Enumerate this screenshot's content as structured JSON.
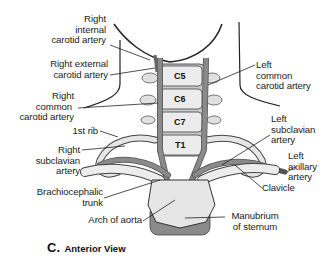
{
  "figure": {
    "caption_letter": "C.",
    "caption_text": "Anterior View",
    "vertebrae": [
      "C5",
      "C6",
      "C7",
      "T1"
    ],
    "labels": {
      "right_internal_carotid": [
        "Right",
        "internal",
        "carotid artery"
      ],
      "right_external_carotid": [
        "Right external",
        "carotid artery"
      ],
      "right_common_carotid": [
        "Right",
        "common",
        "carotid artery"
      ],
      "first_rib": [
        "1st rib"
      ],
      "right_subclavian": [
        "Right",
        "subclavian",
        "artery"
      ],
      "brachiocephalic_trunk": [
        "Brachiocephalic",
        "trunk"
      ],
      "arch_of_aorta": [
        "Arch of aorta"
      ],
      "left_common_carotid": [
        "Left",
        "common",
        "carotid artery"
      ],
      "left_subclavian": [
        "Left",
        "subclavian",
        "artery"
      ],
      "left_axillary": [
        "Left",
        "axillary",
        "artery"
      ],
      "clavicle": [
        "Clavicle"
      ],
      "manubrium": [
        "Manubrium",
        "of sternum"
      ]
    },
    "colors": {
      "artery": "#8a8a8a",
      "bone": "#e6e6e6",
      "bone_shadow": "#b5b5b5",
      "outline": "#333333"
    }
  }
}
